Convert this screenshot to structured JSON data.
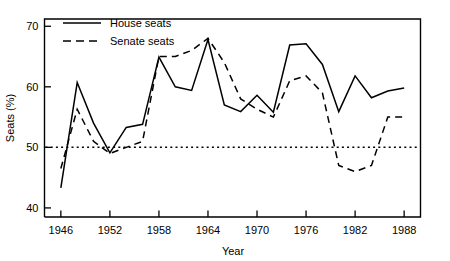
{
  "chart_data": {
    "type": "line",
    "title": "",
    "subtitle": "",
    "xlabel": "Year",
    "ylabel": "Seats (%)",
    "xlim": [
      1944,
      1990
    ],
    "ylim": [
      38.5,
      71.2
    ],
    "grid": false,
    "legend_position": "top-left-inside",
    "x_ticks": [
      1946,
      1952,
      1958,
      1964,
      1970,
      1976,
      1982,
      1988
    ],
    "x_tick_labels": [
      "1946",
      "1952",
      "1958",
      "1964",
      "1970",
      "1976",
      "1982",
      "1988"
    ],
    "y_ticks": [
      40,
      50,
      60,
      70
    ],
    "y_tick_labels": [
      "40",
      "50",
      "60",
      "70"
    ],
    "reference_line": {
      "name": "fifty-percent-line",
      "value": 50,
      "style": "dotted"
    },
    "x": [
      1946,
      1948,
      1950,
      1952,
      1954,
      1956,
      1958,
      1960,
      1962,
      1964,
      1966,
      1968,
      1970,
      1972,
      1974,
      1976,
      1978,
      1980,
      1982,
      1984,
      1986,
      1988
    ],
    "series": [
      {
        "name": "House seats",
        "style": "solid",
        "color": "#000000",
        "values": [
          43.3,
          60.7,
          54.0,
          49.1,
          53.3,
          53.8,
          64.9,
          60.0,
          59.4,
          67.8,
          57.0,
          55.9,
          58.6,
          55.8,
          66.9,
          67.1,
          63.7,
          55.9,
          61.8,
          58.2,
          59.3,
          59.8
        ]
      },
      {
        "name": "Senate seats",
        "style": "dashed",
        "color": "#000000",
        "values": [
          46.5,
          56.3,
          51.0,
          49.0,
          50.0,
          51.0,
          65.0,
          65.0,
          66.0,
          68.0,
          64.0,
          58.0,
          56.3,
          55.0,
          61.0,
          61.8,
          59.0,
          47.0,
          46.0,
          47.0,
          55.0,
          55.0
        ]
      }
    ]
  },
  "legend": {
    "entries": [
      {
        "label": "House seats",
        "style": "solid"
      },
      {
        "label": "Senate seats",
        "style": "dashed"
      }
    ]
  }
}
